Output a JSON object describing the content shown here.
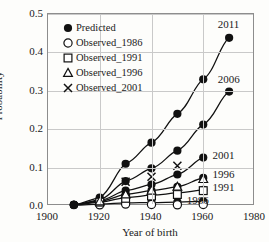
{
  "chart_data": {
    "type": "line",
    "title": "",
    "xlabel": "Year of birth",
    "ylabel": "Probability",
    "xlim": [
      1900,
      1980
    ],
    "ylim": [
      0.0,
      0.5
    ],
    "xticks": [
      "1900",
      "1920",
      "1940",
      "1960",
      "1980"
    ],
    "xtick_values": [
      1900,
      1920,
      1940,
      1960,
      1980
    ],
    "yticks": [
      "0.0",
      "0.1",
      "0.2",
      "0.3",
      "0.4",
      "0.5"
    ],
    "ytick_values": [
      0.0,
      0.1,
      0.2,
      0.3,
      0.4,
      0.5
    ],
    "grid": true,
    "legend_position": "upper-left-inside",
    "legend": [
      {
        "label": "Predicted",
        "marker": "filled-circle"
      },
      {
        "label": "Observed_1986",
        "marker": "open-circle"
      },
      {
        "label": "Observed_1991",
        "marker": "open-square"
      },
      {
        "label": "Observed_1996",
        "marker": "open-triangle"
      },
      {
        "label": "Observed_2001",
        "marker": "cross-x"
      }
    ],
    "series": [
      {
        "name": "2011",
        "marker": "filled-circle",
        "label": "2011",
        "label_x": 1966,
        "label_y": 0.472,
        "x": [
          1910,
          1920,
          1930,
          1940,
          1950,
          1960,
          1970
        ],
        "values": [
          0.003,
          0.022,
          0.11,
          0.165,
          0.24,
          0.33,
          0.438
        ]
      },
      {
        "name": "2006",
        "marker": "filled-circle",
        "label": "2006",
        "label_x": 1966,
        "label_y": 0.328,
        "x": [
          1910,
          1920,
          1930,
          1940,
          1950,
          1960,
          1970
        ],
        "values": [
          0.003,
          0.016,
          0.065,
          0.098,
          0.144,
          0.212,
          0.298
        ]
      },
      {
        "name": "2001",
        "marker": "filled-circle",
        "label": "2001",
        "label_x": 1964,
        "label_y": 0.131,
        "x": [
          1910,
          1920,
          1930,
          1940,
          1950,
          1960
        ],
        "values": [
          0.003,
          0.014,
          0.04,
          0.056,
          0.082,
          0.126
        ]
      },
      {
        "name": "1996",
        "marker": "filled-circle",
        "label": "1996",
        "label_x": 1964,
        "label_y": 0.082,
        "x": [
          1910,
          1920,
          1930,
          1940,
          1950,
          1960
        ],
        "values": [
          0.003,
          0.012,
          0.03,
          0.04,
          0.05,
          0.073
        ]
      },
      {
        "name": "1991",
        "marker": "filled-circle",
        "label": "1991",
        "label_x": 1964,
        "label_y": 0.047,
        "x": [
          1910,
          1920,
          1930,
          1940,
          1950,
          1960
        ],
        "values": [
          0.003,
          0.01,
          0.022,
          0.028,
          0.034,
          0.042
        ]
      },
      {
        "name": "1986",
        "marker": "filled-circle",
        "label": "1986",
        "label_x": 1954,
        "label_y": 0.013,
        "x": [
          1910,
          1920,
          1930,
          1940,
          1950,
          1960
        ],
        "values": [
          0.002,
          0.005,
          0.008,
          0.009,
          0.01,
          0.012
        ]
      }
    ],
    "observed": [
      {
        "name": "Observed_1986",
        "marker": "open-circle",
        "x": [
          1920,
          1930,
          1940,
          1950,
          1960
        ],
        "values": [
          0.003,
          0.005,
          0.004,
          0.003,
          0.004
        ]
      },
      {
        "name": "Observed_1991",
        "marker": "open-square",
        "x": [
          1920,
          1930,
          1940,
          1950,
          1960
        ],
        "values": [
          0.01,
          0.02,
          0.026,
          0.03,
          0.04
        ]
      },
      {
        "name": "Observed_1996",
        "marker": "open-triangle",
        "x": [
          1920,
          1930,
          1940,
          1950,
          1960
        ],
        "values": [
          0.012,
          0.03,
          0.04,
          0.05,
          0.07
        ]
      },
      {
        "name": "Observed_2001",
        "marker": "cross-x",
        "x": [
          1930,
          1940,
          1950
        ],
        "values": [
          0.063,
          0.076,
          0.105
        ]
      }
    ]
  }
}
